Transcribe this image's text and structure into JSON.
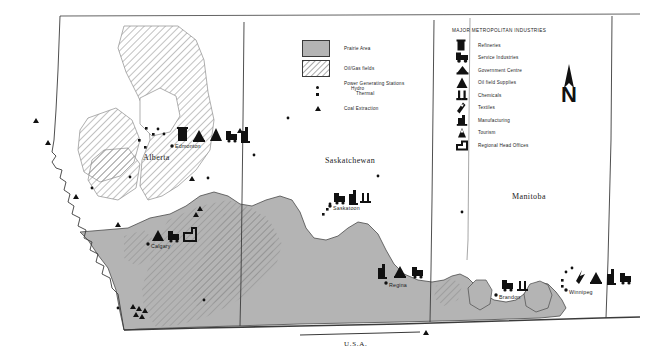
{
  "map": {
    "title_bottom": "U.S.A.",
    "provinces": [
      {
        "name": "Alberta",
        "x": 143,
        "y": 158
      },
      {
        "name": "Saskatchewan",
        "x": 325,
        "y": 161
      },
      {
        "name": "Manitoba",
        "x": 512,
        "y": 197
      }
    ],
    "cities": [
      {
        "name": "Edmonton",
        "x": 176,
        "y": 148,
        "dot_x": 172,
        "dot_y": 144,
        "industries": [
          "refineries",
          "government-centre",
          "oil-field-supplies",
          "service-industries",
          "manufacturing"
        ]
      },
      {
        "name": "Calgary",
        "x": 152,
        "y": 246,
        "dot_x": 148,
        "dot_y": 242,
        "industries": [
          "oil-field-supplies",
          "service-industries",
          "regional-head-offices"
        ]
      },
      {
        "name": "Saskatoon",
        "x": 334,
        "y": 208,
        "dot_x": 330,
        "dot_y": 204,
        "industries": [
          "service-industries",
          "manufacturing",
          "chemicals"
        ]
      },
      {
        "name": "Regina",
        "x": 390,
        "y": 285,
        "dot_x": 386,
        "dot_y": 281,
        "industries": [
          "manufacturing",
          "government-centre",
          "service-industries"
        ]
      },
      {
        "name": "Brandon",
        "x": 500,
        "y": 297,
        "dot_x": 496,
        "dot_y": 293,
        "industries": [
          "service-industries",
          "chemicals"
        ]
      },
      {
        "name": "Winnipeg",
        "x": 570,
        "y": 292,
        "dot_x": 566,
        "dot_y": 288,
        "industries": [
          "textiles",
          "government-centre",
          "manufacturing",
          "service-industries"
        ]
      }
    ],
    "north_arrow_label": "N"
  },
  "legend_symbols": {
    "items": [
      {
        "label": "Prairie Area",
        "symbol": "prairie-swatch"
      },
      {
        "label": "Oil/Gas fields",
        "symbol": "oilgas-swatch"
      }
    ],
    "power_stations": {
      "heading": "Power Generating Stations",
      "sub": [
        "Hydro",
        "Thermal"
      ]
    },
    "coal": {
      "label": "Coal Extraction",
      "symbol": "triangle"
    }
  },
  "legend_industries": {
    "title": "MAJOR METROPOLITAN INDUSTRIES",
    "items": [
      {
        "label": "Refineries",
        "icon": "refineries-icon"
      },
      {
        "label": "Service Industries",
        "icon": "service-industries-icon"
      },
      {
        "label": "Government Centre",
        "icon": "government-centre-icon"
      },
      {
        "label": "Oil field Supplies",
        "icon": "oil-field-supplies-icon"
      },
      {
        "label": "Chemicals",
        "icon": "chemicals-icon"
      },
      {
        "label": "Textiles",
        "icon": "textiles-icon"
      },
      {
        "label": "Manufacturing",
        "icon": "manufacturing-icon"
      },
      {
        "label": "Tourism",
        "icon": "tourism-icon"
      },
      {
        "label": "Regional Head Offices",
        "icon": "regional-head-offices-icon"
      }
    ]
  },
  "colors": {
    "prairie_fill": "#b4b4b4",
    "hatch_stroke": "#8d8d8d",
    "outline": "#3b3b3b",
    "symbol": "#111111"
  }
}
